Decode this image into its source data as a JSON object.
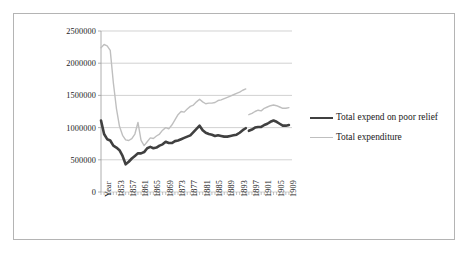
{
  "figure": {
    "background": "#ffffff",
    "frame_color": "#b4b4b4"
  },
  "chart_data": {
    "type": "line",
    "title": "",
    "subtitle": "",
    "xlabel": "",
    "ylabel": "",
    "grid": true,
    "grid_axis": "y",
    "legend_position": "right",
    "ylim": [
      0,
      2500000
    ],
    "yticks": [
      0,
      500000,
      1000000,
      1500000,
      2000000,
      2500000
    ],
    "ytick_labels": [
      "0",
      "500000",
      "1000000",
      "1500000",
      "2000000",
      "2500000"
    ],
    "xlim": [
      1849,
      1911
    ],
    "xtick_labels": [
      "Year",
      "1853",
      "1857",
      "1861",
      "1865",
      "1869",
      "1873",
      "1877",
      "1881",
      "1885",
      "1889",
      "1893",
      "1897",
      "1901",
      "1905",
      "1909"
    ],
    "xticks": [
      1849,
      1853,
      1857,
      1861,
      1865,
      1869,
      1873,
      1877,
      1881,
      1885,
      1889,
      1893,
      1897,
      1901,
      1905,
      1909
    ],
    "colors": {
      "series_0": "#404040",
      "series_1": "#bfbfbf",
      "gridline": "#bfbfbf",
      "axis": "#9a9a9a"
    },
    "series": [
      {
        "name": "Total expend on poor relief",
        "color": "#404040",
        "line_width": 2.6,
        "x": [
          1849,
          1850,
          1851,
          1852,
          1853,
          1854,
          1855,
          1856,
          1857,
          1858,
          1859,
          1860,
          1861,
          1862,
          1863,
          1864,
          1865,
          1866,
          1867,
          1868,
          1869,
          1870,
          1871,
          1872,
          1873,
          1874,
          1875,
          1876,
          1877,
          1878,
          1879,
          1880,
          1881,
          1882,
          1883,
          1884,
          1885,
          1886,
          1887,
          1888,
          1889,
          1890,
          1891,
          1892,
          1893,
          1894,
          1895,
          1896
        ],
        "values": [
          1110000,
          900000,
          820000,
          800000,
          720000,
          690000,
          650000,
          560000,
          430000,
          470000,
          520000,
          560000,
          600000,
          600000,
          620000,
          680000,
          700000,
          680000,
          690000,
          720000,
          740000,
          780000,
          760000,
          760000,
          790000,
          800000,
          820000,
          840000,
          860000,
          880000,
          930000,
          980000,
          1030000,
          960000,
          920000,
          900000,
          890000,
          870000,
          880000,
          870000,
          860000,
          860000,
          870000,
          880000,
          890000,
          920000,
          960000,
          990000
        ]
      },
      {
        "name": "Total expend on poor relief",
        "segment": "second",
        "color": "#404040",
        "line_width": 2.6,
        "x": [
          1897,
          1898,
          1899,
          1900,
          1901,
          1902,
          1903,
          1904,
          1905,
          1906,
          1907,
          1908,
          1909,
          1910
        ],
        "values": [
          950000,
          970000,
          1000000,
          1010000,
          1010000,
          1040000,
          1060000,
          1090000,
          1110000,
          1090000,
          1060000,
          1030000,
          1030000,
          1040000
        ]
      },
      {
        "name": "Total expenditure",
        "color": "#bfbfbf",
        "line_width": 1.4,
        "x": [
          1849,
          1850,
          1851,
          1852,
          1853,
          1854,
          1855,
          1856,
          1857,
          1858,
          1859,
          1860,
          1861,
          1862,
          1863,
          1864,
          1865,
          1866,
          1867,
          1868,
          1869,
          1870,
          1871,
          1872,
          1873,
          1874,
          1875,
          1876,
          1877,
          1878,
          1879,
          1880,
          1881,
          1882,
          1883,
          1884,
          1885,
          1886,
          1887,
          1888,
          1889,
          1890,
          1891,
          1892,
          1893,
          1894,
          1895,
          1896
        ],
        "values": [
          2240000,
          2290000,
          2270000,
          2200000,
          1700000,
          1300000,
          1020000,
          880000,
          810000,
          800000,
          830000,
          900000,
          1080000,
          800000,
          720000,
          780000,
          840000,
          830000,
          870000,
          900000,
          960000,
          1000000,
          980000,
          1040000,
          1120000,
          1200000,
          1250000,
          1240000,
          1290000,
          1330000,
          1350000,
          1400000,
          1440000,
          1400000,
          1370000,
          1380000,
          1380000,
          1390000,
          1420000,
          1430000,
          1450000,
          1470000,
          1490000,
          1510000,
          1530000,
          1550000,
          1580000,
          1600000
        ]
      },
      {
        "name": "Total expenditure",
        "segment": "second",
        "color": "#bfbfbf",
        "line_width": 1.4,
        "x": [
          1897,
          1898,
          1899,
          1900,
          1901,
          1902,
          1903,
          1904,
          1905,
          1906,
          1907,
          1908,
          1909,
          1910
        ],
        "values": [
          1200000,
          1220000,
          1250000,
          1270000,
          1260000,
          1300000,
          1320000,
          1340000,
          1350000,
          1340000,
          1320000,
          1300000,
          1300000,
          1310000
        ]
      }
    ]
  },
  "legend": {
    "entries": [
      {
        "label": "Total expend on poor relief",
        "color": "#404040"
      },
      {
        "label": "Total expenditure",
        "color": "#bfbfbf"
      }
    ]
  }
}
